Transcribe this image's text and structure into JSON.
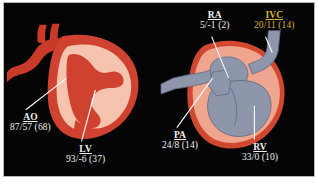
{
  "figure": {
    "kind": "cardiac-pressure-diagram",
    "background_color": "#040404",
    "frame_color": "#b9b9b9",
    "page_color": "#ffffff"
  },
  "palette": {
    "arterial_dark_red": "#c0392b",
    "arterial_mid_red": "#d2472f",
    "myocardium_salmon": "#f0a58f",
    "chamber_light_pink": "#f6c3ae",
    "venous_slate": "#8e96ab",
    "venous_slate_dark": "#6f7a92",
    "leader_line": "#ffffff",
    "label_white": "#f2f2f2",
    "label_gold": "#d8b62a"
  },
  "panels": [
    {
      "id": "left-heart",
      "name": "left-heart-illustration",
      "description": "left-sided cardiac chambers with aorta"
    },
    {
      "id": "right-heart",
      "name": "right-heart-illustration",
      "description": "right-sided cardiac chambers with pulmonary artery and inferior vena cava"
    }
  ],
  "labels": {
    "ao": {
      "abbr": "AO",
      "values": "87/57 (68)",
      "color": "#f2f2f2",
      "panel": "left-heart"
    },
    "lv": {
      "abbr": "LV",
      "values": "93/-6 (37)",
      "color": "#f2f2f2",
      "panel": "left-heart"
    },
    "ra": {
      "abbr": "RA",
      "values": "5/-1 (2)",
      "color": "#f2f2f2",
      "panel": "right-heart"
    },
    "ivc": {
      "abbr": "IVC",
      "values": "20/11 (14)",
      "color": "#d8b62a",
      "panel": "right-heart"
    },
    "pa": {
      "abbr": "PA",
      "values": "24/8  (14)",
      "color": "#f2f2f2",
      "panel": "right-heart"
    },
    "rv": {
      "abbr": "RV",
      "values": "33/0 (10)",
      "color": "#f2f2f2",
      "panel": "right-heart"
    }
  }
}
